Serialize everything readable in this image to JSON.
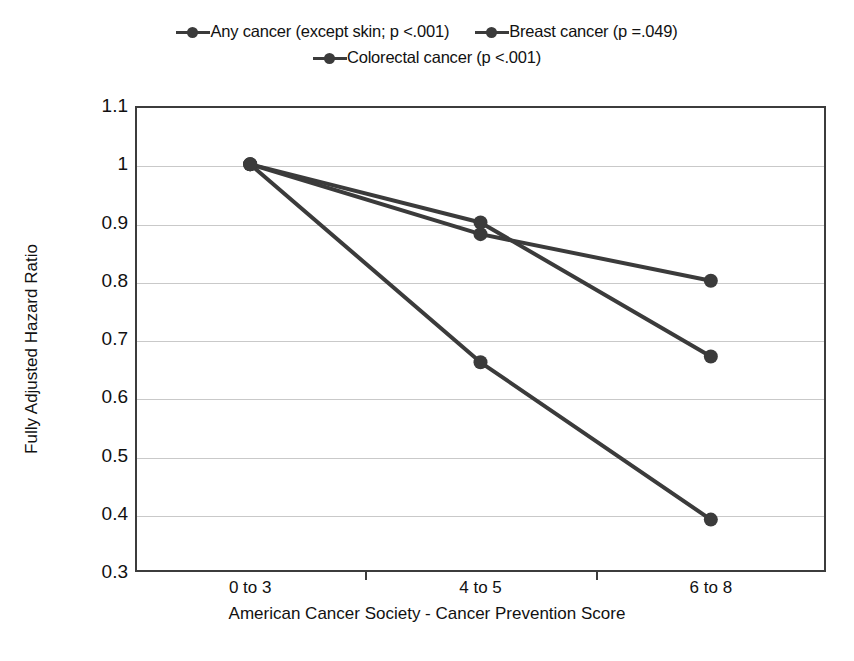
{
  "chart_data": {
    "type": "line",
    "title": "",
    "xlabel": "American Cancer Society - Cancer Prevention Score",
    "ylabel": "Fully Adjusted Hazard Ratio",
    "categories": [
      "0 to 3",
      "4 to 5",
      "6 to 8"
    ],
    "ylim": [
      0.3,
      1.1
    ],
    "yticks": [
      "1.1",
      "1",
      "0.9",
      "0.8",
      "0.7",
      "0.6",
      "0.5",
      "0.4",
      "0.3"
    ],
    "ytick_values": [
      1.1,
      1.0,
      0.9,
      0.8,
      0.7,
      0.6,
      0.5,
      0.4,
      0.3
    ],
    "grid": true,
    "legend_position": "top-center",
    "marker": "circle",
    "series": [
      {
        "name": "Any cancer (except skin; p <.001)",
        "color": "#3b3b3b",
        "values": [
          1.0,
          0.88,
          0.8
        ]
      },
      {
        "name": "Breast cancer (p =.049)",
        "color": "#3b3b3b",
        "values": [
          1.0,
          0.9,
          0.67
        ]
      },
      {
        "name": "Colorectal cancer (p <.001)",
        "color": "#3b3b3b",
        "values": [
          1.0,
          0.66,
          0.39
        ]
      }
    ]
  },
  "legend": {
    "rows": [
      [
        {
          "label": "Any cancer (except skin; p <.001)"
        },
        {
          "label": "Breast cancer (p =.049)"
        }
      ],
      [
        {
          "label": "Colorectal cancer (p <.001)"
        }
      ]
    ]
  },
  "axes": {
    "y_title": "Fully Adjusted Hazard Ratio",
    "x_title": "American Cancer Society - Cancer Prevention Score",
    "y_ticks": [
      "1.1",
      "1",
      "0.9",
      "0.8",
      "0.7",
      "0.6",
      "0.5",
      "0.4",
      "0.3"
    ],
    "x_ticks": [
      "0 to 3",
      "4 to 5",
      "6 to 8"
    ]
  },
  "colors": {
    "series": "#3b3b3b",
    "grid": "#c9c9c9",
    "frame": "#3c3c3c",
    "text": "#111111",
    "background": "#ffffff"
  }
}
